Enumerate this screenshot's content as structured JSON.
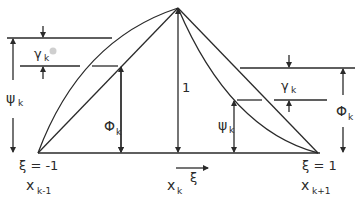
{
  "diagram": {
    "peak_label": "1",
    "left_end": {
      "xi_label": "ξ = -1",
      "x_label": "x",
      "x_sub": "k-1"
    },
    "center": {
      "x_label": "x",
      "x_sub": "k",
      "xi_arrow_label": "ξ"
    },
    "right_end": {
      "xi_label": "ξ = 1",
      "x_label": "x",
      "x_sub": "k+1"
    },
    "left_annotations": {
      "gamma": {
        "symbol": "γ",
        "sub": "k"
      },
      "psi": {
        "symbol": "ψ",
        "sub": "k"
      },
      "phi": {
        "symbol": "Φ",
        "sub": "k"
      }
    },
    "right_annotations": {
      "gamma": {
        "symbol": "γ",
        "sub": "k"
      },
      "phi": {
        "symbol": "Φ",
        "sub": "k"
      },
      "psi": {
        "symbol": "ψ",
        "sub": "k"
      }
    },
    "stroke_color": "#2a2a2a"
  }
}
